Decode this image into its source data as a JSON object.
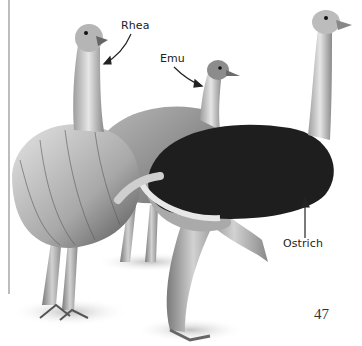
{
  "page": {
    "number": "47"
  },
  "labels": {
    "rhea": "Rhea",
    "emu": "Emu",
    "ostrich": "Ostrich"
  },
  "illustration": {
    "subject": "Rhea, Emu and Ostrich flightless birds drawing",
    "colors": {
      "ostrich_body": "#1e1e1e",
      "plumage_light": "#d8d8d8",
      "plumage_mid": "#9a9a9a",
      "skin": "#c4c4c4",
      "rule": "#bdbdbd"
    }
  }
}
